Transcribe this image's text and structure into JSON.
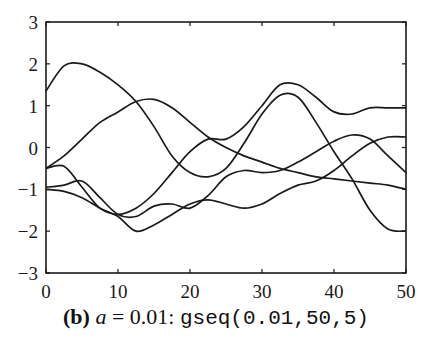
{
  "chart_data": {
    "type": "line",
    "title": "",
    "xlabel": "",
    "ylabel": "",
    "xlim": [
      0,
      50
    ],
    "ylim": [
      -3,
      3
    ],
    "grid": false,
    "legend": "none",
    "x_ticks": [
      0,
      10,
      20,
      30,
      40,
      50
    ],
    "y_ticks": [
      -3,
      -2,
      -1,
      0,
      1,
      2,
      3
    ],
    "x": [
      0,
      2.5,
      5,
      7.5,
      10,
      12.5,
      15,
      17.5,
      20,
      22.5,
      25,
      27.5,
      30,
      32.5,
      35,
      37.5,
      40,
      42.5,
      45,
      47.5,
      50
    ],
    "series": [
      {
        "name": "sample 1",
        "values": [
          1.35,
          1.95,
          2.0,
          1.8,
          1.5,
          1.1,
          0.5,
          -0.2,
          -0.6,
          -0.7,
          -0.5,
          0.1,
          0.8,
          1.25,
          1.2,
          0.6,
          -0.1,
          -0.75,
          -1.5,
          -1.95,
          -2.0
        ]
      },
      {
        "name": "sample 2",
        "values": [
          -0.5,
          -0.2,
          0.2,
          0.6,
          0.85,
          1.1,
          1.15,
          0.95,
          0.6,
          0.25,
          0.0,
          -0.2,
          -0.35,
          -0.5,
          -0.6,
          -0.7,
          -0.75,
          -0.8,
          -0.85,
          -0.9,
          -1.0
        ]
      },
      {
        "name": "sample 3",
        "values": [
          -0.5,
          -0.45,
          -0.95,
          -1.45,
          -1.6,
          -1.45,
          -1.1,
          -0.6,
          -0.1,
          0.2,
          0.2,
          0.5,
          1.0,
          1.5,
          1.5,
          1.2,
          0.85,
          0.8,
          0.95,
          0.95,
          0.95
        ]
      },
      {
        "name": "sample 4",
        "values": [
          -0.95,
          -0.9,
          -0.8,
          -1.2,
          -1.6,
          -1.65,
          -1.4,
          -1.35,
          -1.45,
          -1.15,
          -0.7,
          -0.55,
          -0.6,
          -0.55,
          -0.35,
          -0.1,
          0.15,
          0.3,
          0.2,
          -0.2,
          -0.6
        ]
      },
      {
        "name": "sample 5",
        "values": [
          -1.0,
          -1.05,
          -1.2,
          -1.45,
          -1.65,
          -2.0,
          -1.85,
          -1.6,
          -1.35,
          -1.25,
          -1.35,
          -1.45,
          -1.35,
          -1.1,
          -0.9,
          -0.8,
          -0.55,
          -0.2,
          0.1,
          0.25,
          0.25
        ]
      }
    ],
    "line_color": "#1a1a1a"
  },
  "caption": {
    "label": "(b)",
    "variable": "a",
    "equation": " = 0.01: ",
    "code": "gseq(0.01,50,5)"
  }
}
